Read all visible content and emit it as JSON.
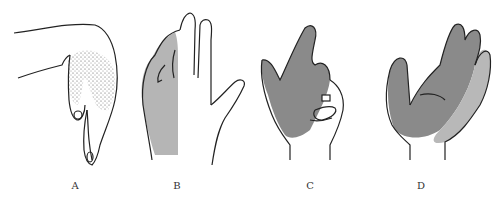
{
  "figure": {
    "panels": [
      {
        "id": "A",
        "label": "A",
        "shading": "stippled",
        "description": "hand in wrist-drop posture, dorsal stippled area over thumb/index web"
      },
      {
        "id": "B",
        "label": "B",
        "shading": "gray",
        "description": "dorsal view of hand with ulnar half shaded gray"
      },
      {
        "id": "C",
        "label": "C",
        "shading": "dark-gray",
        "description": "hand with ring and little fingers flexed, radial region shaded"
      },
      {
        "id": "D",
        "label": "D",
        "shading": "two-tone-gray",
        "description": "palmar view with radial region dark gray and ulnar region light gray"
      }
    ],
    "colors": {
      "line": "#222222",
      "dark_gray": "#8a8a8a",
      "light_gray": "#b8b8b8",
      "stipple": "#333333",
      "background": "#ffffff"
    }
  }
}
